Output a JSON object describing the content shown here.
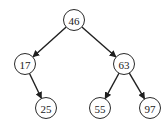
{
  "diagram": {
    "type": "binary-search-tree",
    "root": "46",
    "colors": {
      "node_stroke": "#2a2a2a",
      "node_fill": "#ffffff",
      "edge": "#1f1f1f",
      "text": "#1a1a1a",
      "background": "#ffffff"
    },
    "nodes": [
      {
        "id": "n46",
        "label": "46",
        "x": 74,
        "y": 20,
        "r": 10.5
      },
      {
        "id": "n17",
        "label": "17",
        "x": 25,
        "y": 64,
        "r": 10.5
      },
      {
        "id": "n63",
        "label": "63",
        "x": 124,
        "y": 64,
        "r": 10.5
      },
      {
        "id": "n25",
        "label": "25",
        "x": 46,
        "y": 108,
        "r": 10.5
      },
      {
        "id": "n55",
        "label": "55",
        "x": 100,
        "y": 108,
        "r": 10.5
      },
      {
        "id": "n97",
        "label": "97",
        "x": 150,
        "y": 108,
        "r": 10.5
      }
    ],
    "edges": [
      {
        "from": "n46",
        "to": "n17"
      },
      {
        "from": "n46",
        "to": "n63"
      },
      {
        "from": "n17",
        "to": "n25"
      },
      {
        "from": "n63",
        "to": "n55"
      },
      {
        "from": "n63",
        "to": "n97"
      }
    ]
  }
}
